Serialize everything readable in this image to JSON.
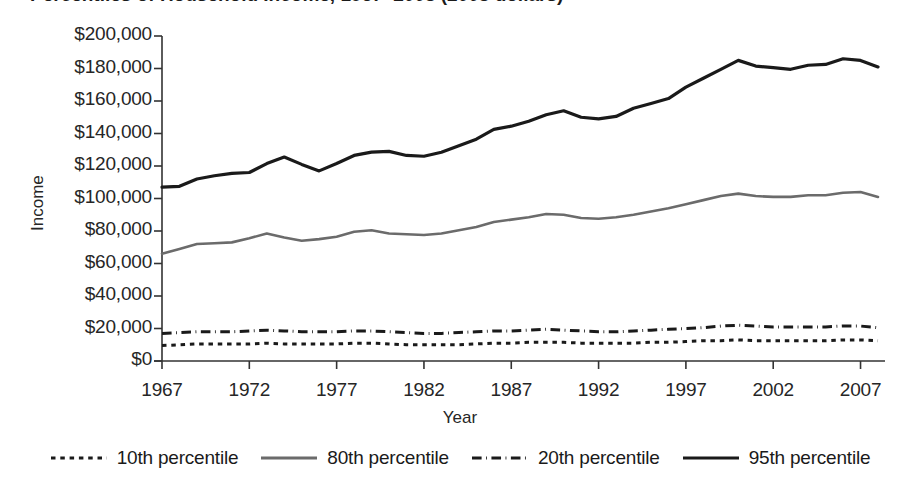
{
  "title": {
    "text": "Percentiles of Household Income, 1967–2008 (2008 dollars)",
    "clipped": true
  },
  "axes": {
    "y_title": "Income",
    "x_title": "Year",
    "y_ticks": [
      "$0",
      "$20,000",
      "$40,000",
      "$60,000",
      "$80,000",
      "$100,000",
      "$120,000",
      "$140,000",
      "$160,000",
      "$180,000",
      "$200,000"
    ],
    "x_ticks": [
      "1967",
      "1972",
      "1977",
      "1982",
      "1987",
      "1992",
      "1997",
      "2002",
      "2007"
    ]
  },
  "legend": {
    "items": [
      {
        "label": "10th percentile",
        "style": "dotted",
        "color": "#1a1a1a"
      },
      {
        "label": "80th percentile",
        "style": "solid",
        "color": "#6b6b6b"
      },
      {
        "label": "20th percentile",
        "style": "dashdot",
        "color": "#1a1a1a"
      },
      {
        "label": "95th percentile",
        "style": "solid",
        "color": "#1a1a1a"
      }
    ]
  },
  "chart_data": {
    "type": "line",
    "title": "Percentiles of Household Income, 1967–2008 (2008 dollars)",
    "xlabel": "Year",
    "ylabel": "Income",
    "xlim": [
      1967,
      2008
    ],
    "ylim": [
      0,
      200000
    ],
    "ytick_step": 20000,
    "xtick_step": 5,
    "grid": false,
    "legend_position": "bottom",
    "x": [
      1967,
      1968,
      1969,
      1970,
      1971,
      1972,
      1973,
      1974,
      1975,
      1976,
      1977,
      1978,
      1979,
      1980,
      1981,
      1982,
      1983,
      1984,
      1985,
      1986,
      1987,
      1988,
      1989,
      1990,
      1991,
      1992,
      1993,
      1994,
      1995,
      1996,
      1997,
      1998,
      1999,
      2000,
      2001,
      2002,
      2003,
      2004,
      2005,
      2006,
      2007,
      2008
    ],
    "series": [
      {
        "name": "95th percentile",
        "style": "solid",
        "color": "#1a1a1a",
        "width": 3.2,
        "values": [
          107000,
          107500,
          112000,
          114000,
          115500,
          116000,
          121500,
          125500,
          121000,
          117000,
          121500,
          126500,
          128500,
          129000,
          126500,
          126000,
          128500,
          132500,
          136500,
          142500,
          144500,
          147500,
          151500,
          154000,
          150000,
          149000,
          150500,
          155500,
          158500,
          161500,
          168500,
          174000,
          179500,
          185000,
          181500,
          180500,
          179500,
          182000,
          182500,
          186000,
          185000,
          181000
        ]
      },
      {
        "name": "80th percentile",
        "style": "solid",
        "color": "#6b6b6b",
        "width": 2.6,
        "values": [
          66000,
          69000,
          72000,
          72500,
          73000,
          75500,
          78500,
          76000,
          74000,
          75000,
          76500,
          79500,
          80500,
          78500,
          78000,
          77500,
          78500,
          80500,
          82500,
          85500,
          87000,
          88500,
          90500,
          90000,
          88000,
          87500,
          88500,
          90000,
          92000,
          94000,
          96500,
          99000,
          101500,
          103000,
          101500,
          101000,
          101000,
          102000,
          102000,
          103500,
          104000,
          101000
        ]
      },
      {
        "name": "20th percentile",
        "style": "dashdot",
        "color": "#1a1a1a",
        "width": 3.0,
        "values": [
          17000,
          17500,
          18000,
          18000,
          18000,
          18500,
          19000,
          18500,
          18000,
          18000,
          18000,
          18500,
          18500,
          18000,
          17500,
          17000,
          17000,
          17500,
          18000,
          18500,
          18500,
          19000,
          19500,
          19000,
          18500,
          18000,
          18000,
          18500,
          19000,
          19500,
          20000,
          20500,
          21500,
          22000,
          21500,
          21000,
          21000,
          21000,
          21000,
          21500,
          21500,
          20500
        ]
      },
      {
        "name": "10th percentile",
        "style": "dotted",
        "color": "#1a1a1a",
        "width": 3.0,
        "values": [
          9500,
          10000,
          10500,
          10500,
          10500,
          10500,
          11000,
          10500,
          10500,
          10500,
          10500,
          11000,
          11000,
          10500,
          10000,
          10000,
          10000,
          10000,
          10500,
          11000,
          11000,
          11500,
          11500,
          11500,
          11000,
          11000,
          11000,
          11000,
          11500,
          11500,
          12000,
          12500,
          12500,
          13000,
          12500,
          12500,
          12500,
          12500,
          12500,
          13000,
          13000,
          12500
        ]
      }
    ]
  },
  "plot_geometry": {
    "left": 162,
    "right": 878,
    "top": 36,
    "bottom": 361
  }
}
